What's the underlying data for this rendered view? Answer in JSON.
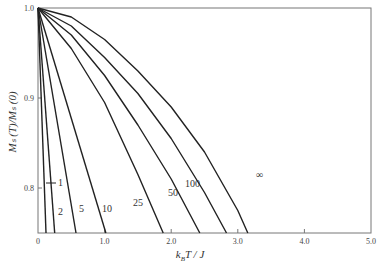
{
  "chart_data": {
    "type": "line",
    "title": "",
    "xlabel": "k_B T / J",
    "ylabel": "M_s(T)/M_s(0)",
    "xlim": [
      0,
      5.0
    ],
    "ylim": [
      0.75,
      1.0
    ],
    "grid": false,
    "x_ticks": [
      "0",
      "1.0",
      "2.0",
      "3.0",
      "4.0",
      "5.0"
    ],
    "y_ticks": [
      "0.8",
      "0.9",
      "1.0"
    ],
    "series": [
      {
        "name": "1",
        "label": "1",
        "x": [
          0,
          0.12
        ],
        "y": [
          1.0,
          0.75
        ]
      },
      {
        "name": "2",
        "label": "2",
        "x": [
          0,
          0.25
        ],
        "y": [
          1.0,
          0.75
        ]
      },
      {
        "name": "5",
        "label": "5",
        "x": [
          0,
          0.57
        ],
        "y": [
          1.0,
          0.75
        ]
      },
      {
        "name": "10",
        "label": "10",
        "x": [
          0,
          1.02
        ],
        "y": [
          1.0,
          0.75
        ]
      },
      {
        "name": "25",
        "label": "25",
        "x": [
          0,
          0.5,
          1.0,
          1.5,
          1.88
        ],
        "y": [
          1.0,
          0.955,
          0.895,
          0.815,
          0.75
        ]
      },
      {
        "name": "50",
        "label": "50",
        "x": [
          0,
          0.5,
          1.0,
          1.5,
          2.0,
          2.43
        ],
        "y": [
          1.0,
          0.97,
          0.925,
          0.87,
          0.81,
          0.75
        ]
      },
      {
        "name": "100",
        "label": "100",
        "x": [
          0,
          0.5,
          1.0,
          1.5,
          2.0,
          2.5,
          2.83
        ],
        "y": [
          1.0,
          0.98,
          0.945,
          0.905,
          0.855,
          0.795,
          0.75
        ]
      },
      {
        "name": "infinity",
        "label": "∞",
        "x": [
          0,
          0.5,
          1.0,
          1.5,
          2.0,
          2.5,
          3.0,
          3.15
        ],
        "y": [
          1.0,
          0.99,
          0.965,
          0.93,
          0.89,
          0.84,
          0.775,
          0.75
        ]
      }
    ],
    "annotations": [
      "1",
      "2",
      "5",
      "10",
      "25",
      "50",
      "100",
      "∞"
    ]
  },
  "labels": {
    "xlabel_k": "k",
    "xlabel_sub": "B",
    "xlabel_rest": "T / J",
    "ylabel": "Mₛ (T)/Mₛ (0)"
  }
}
